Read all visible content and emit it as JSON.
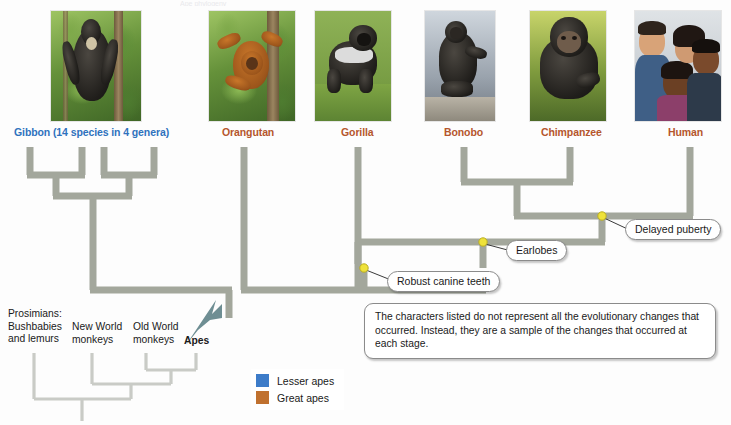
{
  "figure": {
    "type": "phylogenetic-tree",
    "top_cut_text": "Ape phylogeny"
  },
  "tips": [
    {
      "id": "gibbon",
      "label": "Gibbon (14 species in 4 genera)",
      "color_name": "lesser-ape-blue",
      "color": "#2f72bd",
      "label_x": 14,
      "label_y": 126,
      "photo_x": 50,
      "photo_w": 90,
      "group": "Lesser apes",
      "photo_name": "gibbon-photo"
    },
    {
      "id": "orangutan",
      "label": "Orangutan",
      "color_name": "great-ape-brown",
      "color": "#b5562c",
      "label_x": 222,
      "label_y": 126,
      "photo_x": 208,
      "photo_w": 86,
      "group": "Great apes",
      "photo_name": "orangutan-photo"
    },
    {
      "id": "gorilla",
      "label": "Gorilla",
      "color_name": "great-ape-brown",
      "color": "#b5562c",
      "label_x": 341,
      "label_y": 126,
      "photo_x": 314,
      "photo_w": 76,
      "group": "Great apes",
      "photo_name": "gorilla-photo"
    },
    {
      "id": "bonobo",
      "label": "Bonobo",
      "color_name": "great-ape-brown",
      "color": "#b5562c",
      "label_x": 444,
      "label_y": 126,
      "photo_x": 424,
      "photo_w": 70,
      "group": "Great apes",
      "photo_name": "bonobo-photo"
    },
    {
      "id": "chimpanzee",
      "label": "Chimpanzee",
      "color_name": "great-ape-brown",
      "color": "#b5562c",
      "label_x": 541,
      "label_y": 126,
      "photo_x": 529,
      "photo_w": 76,
      "group": "Great apes",
      "photo_name": "chimpanzee-photo"
    },
    {
      "id": "human",
      "label": "Human",
      "color_name": "great-ape-brown",
      "color": "#b5562c",
      "label_x": 668,
      "label_y": 126,
      "photo_x": 634,
      "photo_w": 86,
      "group": "Great apes",
      "photo_name": "human-photo"
    }
  ],
  "character_nodes": [
    {
      "id": "delayed-puberty",
      "label": "Delayed puberty",
      "node_x": 602,
      "node_y": 216,
      "box_x": 625,
      "box_y": 219
    },
    {
      "id": "earlobes",
      "label": "Earlobes",
      "node_x": 483,
      "node_y": 242,
      "box_x": 506,
      "box_y": 238
    },
    {
      "id": "robust-canine-teeth",
      "label": "Robust canine teeth",
      "node_x": 364,
      "node_y": 268,
      "box_x": 387,
      "box_y": 270
    }
  ],
  "note": {
    "text": "The characters listed do not represent all the evolutionary changes that occurred. Instead, they are a sample of the changes that occurred at each stage."
  },
  "inset": {
    "labels": [
      {
        "id": "prosimians",
        "text": "Prosimians:\nBushbabies\nand lemurs",
        "x": 8,
        "y": 310,
        "bold": false
      },
      {
        "id": "new-world-monkeys",
        "text": "New World\nmonkeys",
        "x": 72,
        "y": 322,
        "bold": false
      },
      {
        "id": "old-world-monkeys",
        "text": "Old World\nmonkeys",
        "x": 133,
        "y": 322,
        "bold": false
      },
      {
        "id": "apes",
        "text": "Apes",
        "x": 186,
        "y": 340,
        "bold": true
      }
    ]
  },
  "legend": {
    "items": [
      {
        "id": "lesser-apes",
        "label": "Lesser apes",
        "color": "#3d7cc9"
      },
      {
        "id": "great-apes",
        "label": "Great apes",
        "color": "#c0712f"
      }
    ]
  },
  "colors": {
    "branch": "#a3a79c",
    "inset_branch": "#c9cbc6",
    "node_dot": "#efe23a",
    "arrow": "#6e8e93",
    "lesser_ape": "#3d7cc9",
    "great_ape": "#c0712f",
    "label_blue": "#2f72bd",
    "label_brown": "#b5562c"
  }
}
